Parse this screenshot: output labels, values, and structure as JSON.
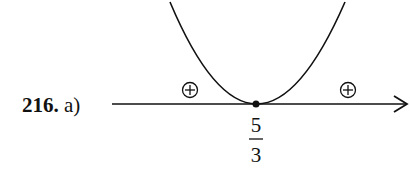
{
  "problem": {
    "number": "216.",
    "part": "a)"
  },
  "diagram": {
    "type": "sign-chart-parabola",
    "root": {
      "numerator": "5",
      "denominator": "3"
    },
    "intervals": [
      {
        "position": "left",
        "sign": "+"
      },
      {
        "position": "right",
        "sign": "+"
      }
    ],
    "colors": {
      "stroke": "#111111",
      "background": "#ffffff"
    }
  }
}
